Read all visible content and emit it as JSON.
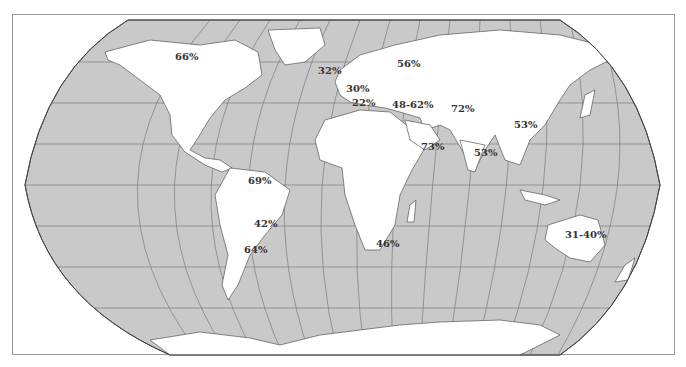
{
  "map": {
    "projection": "Robinson-style world map",
    "colors": {
      "ocean": "#c9c9c9",
      "land": "#ffffff",
      "coast": "#555555",
      "graticule": "#6e6e6e",
      "label": "#333333",
      "frame": "#9a9a9a"
    },
    "labels": [
      {
        "region": "north-america",
        "text": "66%",
        "x": 175,
        "y": 52
      },
      {
        "region": "united-kingdom",
        "text": "32%",
        "x": 318,
        "y": 66
      },
      {
        "region": "northern-europe",
        "text": "56%",
        "x": 397,
        "y": 59
      },
      {
        "region": "western-europe",
        "text": "30%",
        "x": 346,
        "y": 84
      },
      {
        "region": "southern-europe",
        "text": "22%",
        "x": 352,
        "y": 98
      },
      {
        "region": "eastern-mediterranean",
        "text": "48-62%",
        "x": 392,
        "y": 100
      },
      {
        "region": "central-asia",
        "text": "72%",
        "x": 451,
        "y": 104
      },
      {
        "region": "east-asia",
        "text": "53%",
        "x": 514,
        "y": 120
      },
      {
        "region": "arabian-peninsula",
        "text": "73%",
        "x": 421,
        "y": 142
      },
      {
        "region": "south-asia",
        "text": "53%",
        "x": 474,
        "y": 148
      },
      {
        "region": "northern-south-america",
        "text": "69%",
        "x": 248,
        "y": 176
      },
      {
        "region": "brazil-south",
        "text": "42%",
        "x": 254,
        "y": 219
      },
      {
        "region": "southern-cone",
        "text": "64%",
        "x": 244,
        "y": 245
      },
      {
        "region": "southern-africa",
        "text": "46%",
        "x": 376,
        "y": 239
      },
      {
        "region": "australia",
        "text": "31-40%",
        "x": 565,
        "y": 230
      }
    ]
  }
}
